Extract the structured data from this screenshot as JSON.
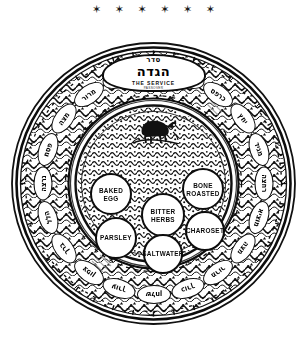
{
  "page": {
    "star_rule": "✶ ✶ ✶ ✶ ✶ ✶",
    "background_color": "#ffffff",
    "ink_color": "#0d0d0d"
  },
  "banner": {
    "hebrew_small": "סדר",
    "hebrew_main": "הגדה",
    "english": "THE SERVICE",
    "english_sub": "PASSOVER"
  },
  "center": {
    "motif": "lamb-shankbone-motif"
  },
  "bowls": [
    {
      "id": "baked-egg",
      "label": "BAKED\nEGG",
      "cx": 100,
      "cy": 152,
      "r": 21
    },
    {
      "id": "bone-roasted",
      "label": "BONE\nROASTED",
      "cx": 192,
      "cy": 147,
      "r": 21
    },
    {
      "id": "bitter-herbs",
      "label": "BITTER\nHERBS",
      "cx": 152,
      "cy": 173,
      "r": 22
    },
    {
      "id": "charoset",
      "label": "CHAROSET",
      "cx": 194,
      "cy": 189,
      "r": 20
    },
    {
      "id": "parsley",
      "label": "PARSLEY",
      "cx": 105,
      "cy": 196,
      "r": 21
    },
    {
      "id": "saltwater",
      "label": "SALTWATER",
      "cx": 152,
      "cy": 212,
      "r": 20
    }
  ],
  "outer_band": {
    "count": 20,
    "cartouches": [
      {
        "text": "קדש"
      },
      {
        "text": "ורחץ"
      },
      {
        "text": "כרפס"
      },
      {
        "text": "יחץ"
      },
      {
        "text": "מגיד"
      },
      {
        "text": "רחצה"
      },
      {
        "text": "מוציא"
      },
      {
        "text": "מצה"
      },
      {
        "text": "מרור"
      },
      {
        "text": "כורך"
      },
      {
        "text": "שלחן"
      },
      {
        "text": "עורך"
      },
      {
        "text": "צפון"
      },
      {
        "text": "ברך"
      },
      {
        "text": "הלל"
      },
      {
        "text": "נרצה"
      },
      {
        "text": "פסח"
      },
      {
        "text": "מצה"
      },
      {
        "text": "מרור"
      },
      {
        "text": "חג"
      }
    ]
  }
}
